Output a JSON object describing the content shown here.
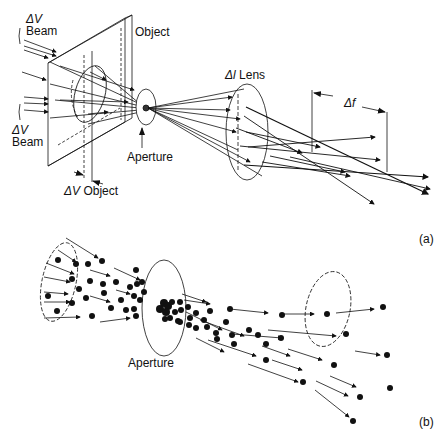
{
  "panel_a": {
    "labels": {
      "delta_v_beam_top_symbol": "ΔV",
      "delta_v_beam_top_word": "Beam",
      "delta_v_beam_bottom_symbol": "ΔV",
      "delta_v_beam_bottom_word": "Beam",
      "object": "Object",
      "aperture": "Aperture",
      "delta_v_object_symbol": "ΔV",
      "delta_v_object_word": "Object",
      "delta_l_symbol": "Δl",
      "lens": "Lens",
      "delta_f": "Δf",
      "panel_tag": "(a)"
    }
  },
  "panel_b": {
    "labels": {
      "aperture": "Aperture",
      "panel_tag": "(b)"
    }
  },
  "colors": {
    "ink": "#111111",
    "background": "#ffffff"
  }
}
